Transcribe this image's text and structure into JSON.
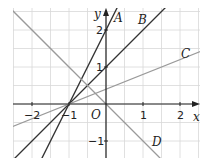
{
  "diagram": {
    "axes": {
      "x_label": "x",
      "y_label": "y",
      "origin_label": "O"
    },
    "x_ticks": [
      {
        "v": -2,
        "label": "−2"
      },
      {
        "v": -1,
        "label": "−1"
      },
      {
        "v": 1,
        "label": "1"
      },
      {
        "v": 2,
        "label": "2"
      }
    ],
    "y_ticks": [
      {
        "v": -1,
        "label": "−1"
      },
      {
        "v": 1,
        "label": "1"
      },
      {
        "v": 2,
        "label": "2"
      }
    ],
    "lines": [
      {
        "name": "A",
        "slope": 2,
        "intercept": 2,
        "color": "#333333"
      },
      {
        "name": "B",
        "slope": 1,
        "intercept": 1,
        "color": "#333333"
      },
      {
        "name": "C",
        "slope": 0.4,
        "intercept": 0.4,
        "color": "#9a9a9a"
      },
      {
        "name": "D",
        "slope": -1,
        "intercept": 0,
        "color": "#9a9a9a"
      }
    ],
    "grid_color": "#d8d8d8"
  }
}
